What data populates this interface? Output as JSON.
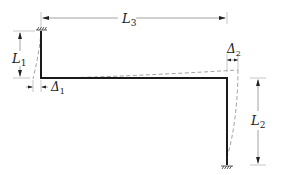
{
  "figure": {
    "type": "portal frame deflection diagram",
    "labels": {
      "L1": {
        "main": "L",
        "sub": "1"
      },
      "L2": {
        "main": "L",
        "sub": "2"
      },
      "L3": {
        "main": "L",
        "sub": "3"
      },
      "Delta1": {
        "main": "Δ",
        "sub": "1"
      },
      "Delta2": {
        "main": "Δ",
        "sub": "2"
      }
    },
    "supports": [
      {
        "name": "left-fixed-support",
        "position": "top-left"
      },
      {
        "name": "right-fixed-support",
        "position": "bottom-right"
      }
    ],
    "members": [
      {
        "name": "left-column",
        "length_label": "L1"
      },
      {
        "name": "horizontal-beam",
        "length_label": "L3"
      },
      {
        "name": "right-column",
        "length_label": "L2"
      }
    ],
    "colors": {
      "member": "#1a1a1a",
      "deflected_shape": "#9a9a9a",
      "dimension": "#8a8a8a"
    }
  }
}
